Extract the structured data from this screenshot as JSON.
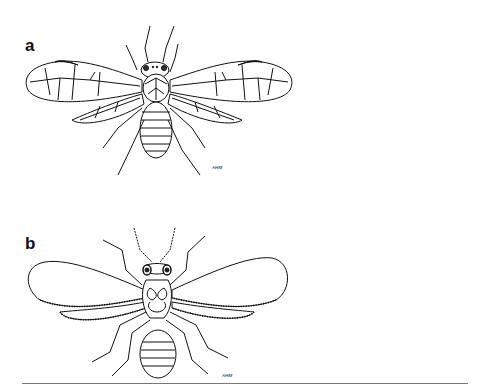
{
  "figure": {
    "panels": [
      {
        "label": "a",
        "description": "Dorsal view line drawing of a winged insect with net-veined wings and dark pterostigma at wing tips",
        "signature": "ᴀʜᴍ"
      },
      {
        "label": "b",
        "description": "Dorsal view line drawing of a winged insect with reduced venation and hair-fringed wing margins",
        "signature": "ᴀʜᴍ"
      }
    ]
  },
  "colors": {
    "ink": "#111111",
    "background": "#ffffff",
    "rule": "#777777"
  }
}
